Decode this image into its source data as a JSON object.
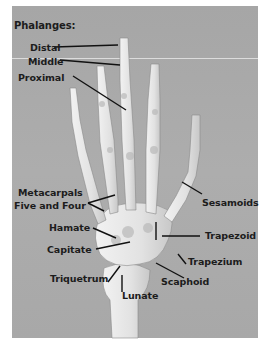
{
  "figure": {
    "title": "Phalanges:",
    "background_color": "#a9a9a9",
    "bone_color": "#e6e6e6",
    "label_color": "#1c1c1c"
  },
  "labels": {
    "distal": "Distal",
    "middle": "Middle",
    "proximal": "Proximal",
    "metacarpals_line1": "Metacarpals",
    "metacarpals_line2": "Five and Four",
    "hamate": "Hamate",
    "capitate": "Capitate",
    "triquetrum": "Triquetrum",
    "lunate": "Lunate",
    "scaphoid": "Scaphoid",
    "trapezium": "Trapezium",
    "trapezoid": "Trapezoid",
    "sesamoids": "Sesamoids"
  }
}
